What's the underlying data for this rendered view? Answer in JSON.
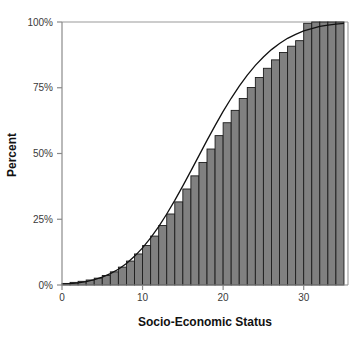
{
  "chart_data": {
    "type": "bar",
    "title": "",
    "subtitle": "",
    "xlabel": "Socio-Economic Status",
    "ylabel": "Percent",
    "xlim": [
      0,
      35.5
    ],
    "ylim": [
      0,
      100
    ],
    "xticks": [
      0,
      10,
      20,
      30
    ],
    "xticklabels": [
      "0",
      "10",
      "20",
      "30"
    ],
    "yticks": [
      0,
      25,
      50,
      75,
      100
    ],
    "yticklabels": [
      "0%",
      "25%",
      "50%",
      "75%",
      "100%"
    ],
    "grid": false,
    "legend": null,
    "bar_color": "#808080",
    "bar_edge_color": "#1c1c1c",
    "curve_color": "#111111",
    "axis_color": "#8a8a8a",
    "categories": [
      1,
      2,
      3,
      4,
      5,
      6,
      7,
      8,
      9,
      10,
      11,
      12,
      13,
      14,
      15,
      16,
      17,
      18,
      19,
      20,
      21,
      22,
      23,
      24,
      25,
      26,
      27,
      28,
      29,
      30,
      31,
      32,
      33,
      34,
      35
    ],
    "values": [
      0.6,
      1.0,
      1.4,
      1.9,
      2.6,
      3.6,
      5.0,
      6.8,
      9.1,
      11.8,
      15.0,
      18.6,
      22.6,
      27.0,
      31.6,
      36.5,
      41.5,
      46.6,
      51.7,
      56.8,
      61.7,
      66.4,
      70.9,
      75.1,
      78.9,
      82.4,
      85.6,
      88.4,
      90.8,
      92.9,
      99.5,
      100.0,
      100.0,
      100.0,
      100.0
    ],
    "series": [
      {
        "name": "Cumulative percent",
        "type": "bar",
        "values": [
          0.6,
          1.0,
          1.4,
          1.9,
          2.6,
          3.6,
          5.0,
          6.8,
          9.1,
          11.8,
          15.0,
          18.6,
          22.6,
          27.0,
          31.6,
          36.5,
          41.5,
          46.6,
          51.7,
          56.8,
          61.7,
          66.4,
          70.9,
          75.1,
          78.9,
          82.4,
          85.6,
          88.4,
          90.8,
          92.9,
          99.5,
          100.0,
          100.0,
          100.0,
          100.0
        ]
      },
      {
        "name": "Cumulative normal curve",
        "type": "line",
        "x": [
          0,
          1,
          2,
          3,
          4,
          5,
          6,
          7,
          8,
          9,
          10,
          11,
          12,
          13,
          14,
          15,
          16,
          17,
          18,
          19,
          20,
          21,
          22,
          23,
          24,
          25,
          26,
          27,
          28,
          29,
          30,
          31,
          32,
          33,
          34,
          35
        ],
        "values": [
          0.3,
          0.5,
          0.8,
          1.3,
          2.0,
          3.0,
          4.3,
          6.0,
          8.2,
          10.9,
          14.1,
          17.9,
          22.2,
          27.0,
          32.2,
          37.7,
          43.4,
          49.2,
          55.0,
          60.6,
          66.0,
          71.0,
          75.6,
          79.8,
          83.5,
          86.7,
          89.5,
          91.8,
          93.8,
          95.3,
          96.6,
          97.5,
          98.3,
          98.8,
          99.2,
          99.5
        ]
      }
    ]
  },
  "axes": {
    "x_title": "Socio-Economic Status",
    "y_title": "Percent"
  }
}
